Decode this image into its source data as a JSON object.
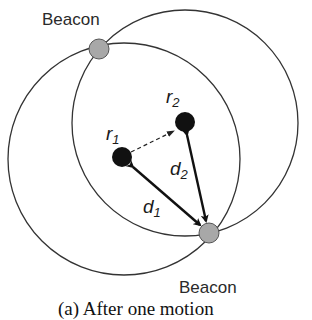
{
  "diagram": {
    "beacon_top_label": "Beacon",
    "beacon_bottom_label": "Beacon",
    "robot1": {
      "name": "r",
      "sub": "1"
    },
    "robot2": {
      "name": "r",
      "sub": "2"
    },
    "distance1": {
      "name": "d",
      "sub": "1"
    },
    "distance2": {
      "name": "d",
      "sub": "2"
    },
    "caption": "(a) After one motion",
    "colors": {
      "beacon": "#a8a8a8",
      "robot": "#111111",
      "circle": "#333333"
    }
  }
}
